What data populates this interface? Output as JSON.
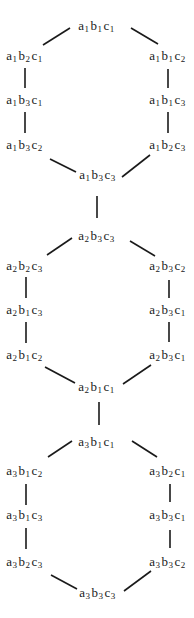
{
  "diagram": {
    "title": "",
    "nodes": [
      {
        "id": "n0",
        "a": "1",
        "b": "1",
        "c": "1",
        "x": 97,
        "y": 26
      },
      {
        "id": "n1",
        "a": "1",
        "b": "2",
        "c": "1",
        "x": 25,
        "y": 56
      },
      {
        "id": "n2",
        "a": "1",
        "b": "1",
        "c": "2",
        "x": 168,
        "y": 56
      },
      {
        "id": "n3",
        "a": "1",
        "b": "3",
        "c": "1",
        "x": 25,
        "y": 100
      },
      {
        "id": "n4",
        "a": "1",
        "b": "1",
        "c": "3",
        "x": 168,
        "y": 100
      },
      {
        "id": "n5",
        "a": "1",
        "b": "3",
        "c": "2",
        "x": 25,
        "y": 145
      },
      {
        "id": "n6",
        "a": "1",
        "b": "2",
        "c": "3",
        "x": 168,
        "y": 145
      },
      {
        "id": "n7",
        "a": "1",
        "b": "3",
        "c": "3",
        "x": 98,
        "y": 175
      },
      {
        "id": "n8",
        "a": "2",
        "b": "3",
        "c": "3",
        "x": 97,
        "y": 236
      },
      {
        "id": "n9",
        "a": "2",
        "b": "2",
        "c": "3",
        "x": 25,
        "y": 266
      },
      {
        "id": "n10",
        "a": "2",
        "b": "3",
        "c": "2",
        "x": 168,
        "y": 266
      },
      {
        "id": "n11",
        "a": "2",
        "b": "1",
        "c": "3",
        "x": 25,
        "y": 310
      },
      {
        "id": "n12",
        "a": "2",
        "b": "3",
        "c": "1",
        "x": 168,
        "y": 310
      },
      {
        "id": "n13",
        "a": "2",
        "b": "1",
        "c": "2",
        "x": 25,
        "y": 355
      },
      {
        "id": "n14",
        "a": "2",
        "b": "3",
        "c": "1",
        "x": 168,
        "y": 355
      },
      {
        "id": "n15",
        "a": "2",
        "b": "1",
        "c": "1",
        "x": 97,
        "y": 387
      },
      {
        "id": "n16",
        "a": "3",
        "b": "1",
        "c": "1",
        "x": 97,
        "y": 442
      },
      {
        "id": "n17",
        "a": "3",
        "b": "1",
        "c": "2",
        "x": 25,
        "y": 471
      },
      {
        "id": "n18",
        "a": "3",
        "b": "2",
        "c": "1",
        "x": 168,
        "y": 471
      },
      {
        "id": "n19",
        "a": "3",
        "b": "1",
        "c": "3",
        "x": 25,
        "y": 515
      },
      {
        "id": "n20",
        "a": "3",
        "b": "3",
        "c": "1",
        "x": 168,
        "y": 515
      },
      {
        "id": "n21",
        "a": "3",
        "b": "2",
        "c": "3",
        "x": 25,
        "y": 562
      },
      {
        "id": "n22",
        "a": "3",
        "b": "3",
        "c": "2",
        "x": 168,
        "y": 562
      },
      {
        "id": "n23",
        "a": "3",
        "b": "3",
        "c": "3",
        "x": 98,
        "y": 593
      }
    ],
    "edges": [
      {
        "x1": 70,
        "y1": 28,
        "x2": 43,
        "y2": 45
      },
      {
        "x1": 131,
        "y1": 28,
        "x2": 158,
        "y2": 44
      },
      {
        "x1": 25,
        "y1": 68,
        "x2": 25,
        "y2": 88
      },
      {
        "x1": 168,
        "y1": 69,
        "x2": 168,
        "y2": 88
      },
      {
        "x1": 25,
        "y1": 112,
        "x2": 25,
        "y2": 133
      },
      {
        "x1": 168,
        "y1": 112,
        "x2": 168,
        "y2": 133
      },
      {
        "x1": 50,
        "y1": 159,
        "x2": 76,
        "y2": 172
      },
      {
        "x1": 150,
        "y1": 155,
        "x2": 122,
        "y2": 177
      },
      {
        "x1": 97,
        "y1": 196,
        "x2": 97,
        "y2": 218
      },
      {
        "x1": 72,
        "y1": 238,
        "x2": 47,
        "y2": 255
      },
      {
        "x1": 130,
        "y1": 241,
        "x2": 155,
        "y2": 256
      },
      {
        "x1": 26,
        "y1": 277,
        "x2": 26,
        "y2": 298
      },
      {
        "x1": 169,
        "y1": 280,
        "x2": 169,
        "y2": 298
      },
      {
        "x1": 26,
        "y1": 322,
        "x2": 26,
        "y2": 343
      },
      {
        "x1": 169,
        "y1": 322,
        "x2": 169,
        "y2": 342
      },
      {
        "x1": 45,
        "y1": 367,
        "x2": 75,
        "y2": 383
      },
      {
        "x1": 151,
        "y1": 365,
        "x2": 123,
        "y2": 384
      },
      {
        "x1": 99,
        "y1": 402,
        "x2": 99,
        "y2": 425
      },
      {
        "x1": 72,
        "y1": 441,
        "x2": 48,
        "y2": 457
      },
      {
        "x1": 132,
        "y1": 441,
        "x2": 157,
        "y2": 457
      },
      {
        "x1": 26,
        "y1": 484,
        "x2": 26,
        "y2": 505
      },
      {
        "x1": 170,
        "y1": 484,
        "x2": 170,
        "y2": 502
      },
      {
        "x1": 26,
        "y1": 528,
        "x2": 26,
        "y2": 549
      },
      {
        "x1": 170,
        "y1": 530,
        "x2": 170,
        "y2": 548
      },
      {
        "x1": 51,
        "y1": 575,
        "x2": 77,
        "y2": 589
      },
      {
        "x1": 151,
        "y1": 571,
        "x2": 124,
        "y2": 591
      }
    ],
    "colors": {
      "line": "#1a1a1a",
      "text": "#1a1a1a",
      "background": "#ffffff"
    }
  }
}
